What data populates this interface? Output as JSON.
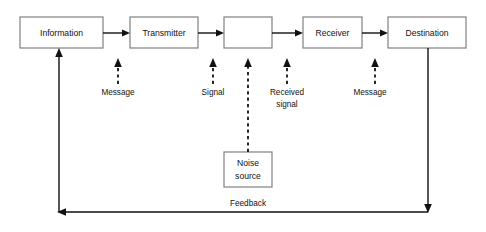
{
  "diagram": {
    "background_color": "#ffffff",
    "line_color": "#111111",
    "box_stroke_color": "#808080",
    "box_fill_color": "#ffffff",
    "nodes": [
      {
        "id": "information",
        "label": "Information",
        "x": 20,
        "y": 17,
        "w": 83,
        "h": 31
      },
      {
        "id": "transmitter",
        "label": "Transmitter",
        "x": 130,
        "y": 17,
        "w": 68,
        "h": 31
      },
      {
        "id": "channel",
        "label": "",
        "x": 224,
        "y": 17,
        "w": 48,
        "h": 31
      },
      {
        "id": "receiver",
        "label": "Receiver",
        "x": 303,
        "y": 17,
        "w": 59,
        "h": 31
      },
      {
        "id": "destination",
        "label": "Destination",
        "x": 388,
        "y": 17,
        "w": 78,
        "h": 31
      },
      {
        "id": "noise-source",
        "label_line1": "Noise",
        "label_line2": "source",
        "x": 224,
        "y": 152,
        "w": 48,
        "h": 35
      }
    ],
    "flow_arrows": [
      {
        "id": "information-to-transmitter",
        "from": "information",
        "to": "transmitter",
        "x1": 103,
        "x2": 130,
        "y": 33
      },
      {
        "id": "transmitter-to-channel",
        "from": "transmitter",
        "to": "channel",
        "x1": 198,
        "x2": 224,
        "y": 33
      },
      {
        "id": "channel-to-receiver",
        "from": "channel",
        "to": "receiver",
        "x1": 272,
        "x2": 303,
        "y": 33
      },
      {
        "id": "receiver-to-destination",
        "from": "receiver",
        "to": "destination",
        "x1": 362,
        "x2": 388,
        "y": 33
      }
    ],
    "annotation_arrows": [
      {
        "id": "message-to-transmitter",
        "label": "Message",
        "x": 118,
        "arrow_top": 60,
        "arrow_bottom": 84,
        "label_y": 93
      },
      {
        "id": "signal-to-channel",
        "label": "Signal",
        "x": 213,
        "arrow_top": 60,
        "arrow_bottom": 84,
        "label_y": 93
      },
      {
        "id": "received-signal-to-receiver",
        "label_line1": "Received",
        "label_line2": "signal",
        "x": 287,
        "arrow_top": 60,
        "arrow_bottom": 84,
        "label_y": 93,
        "label2_y": 105
      },
      {
        "id": "message-to-destination",
        "label": "Message",
        "x": 375,
        "arrow_top": 60,
        "arrow_bottom": 84,
        "label_y": 93
      }
    ],
    "noise_arrow": {
      "id": "noise-to-channel",
      "x": 248,
      "arrow_top": 58,
      "line_bottom": 152
    },
    "feedback": {
      "id": "feedback-loop",
      "label": "Feedback",
      "label_x": 248,
      "label_y": 204,
      "line_y": 212,
      "left_x": 59,
      "right_x": 428,
      "rise_top_y": 48,
      "drop_top_y": 48
    }
  }
}
